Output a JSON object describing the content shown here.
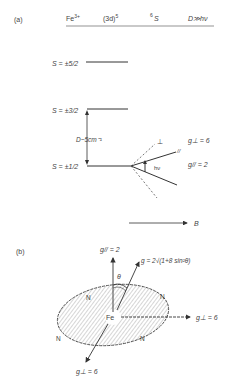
{
  "panel_a": {
    "label": "(a)",
    "header": {
      "ion": "Fe",
      "ion_charge": "3+",
      "config": "(3d)",
      "config_exp": "5",
      "term_sup": "6",
      "term": "S",
      "condition": "D≫hν"
    },
    "levels": [
      {
        "label": "S = ±5/2"
      },
      {
        "label": "S = ±3/2"
      },
      {
        "label": "S = ±1/2"
      }
    ],
    "splitting": "D~5cm⁻¹",
    "perp_symbol": "⊥",
    "par_symbol": "//",
    "hv": "hν",
    "g_perp": "g⊥ = 6",
    "g_par": "g// = 2",
    "field_label": "B"
  },
  "panel_b": {
    "label": "(b)",
    "g_par": "g// = 2",
    "g_formula": "g = 2√(1+8 sin²θ)",
    "theta": "θ",
    "center": "Fe",
    "ligand": "N",
    "g_perp_right": "g⊥ = 6",
    "g_perp_bottom": "g⊥ = 6"
  }
}
